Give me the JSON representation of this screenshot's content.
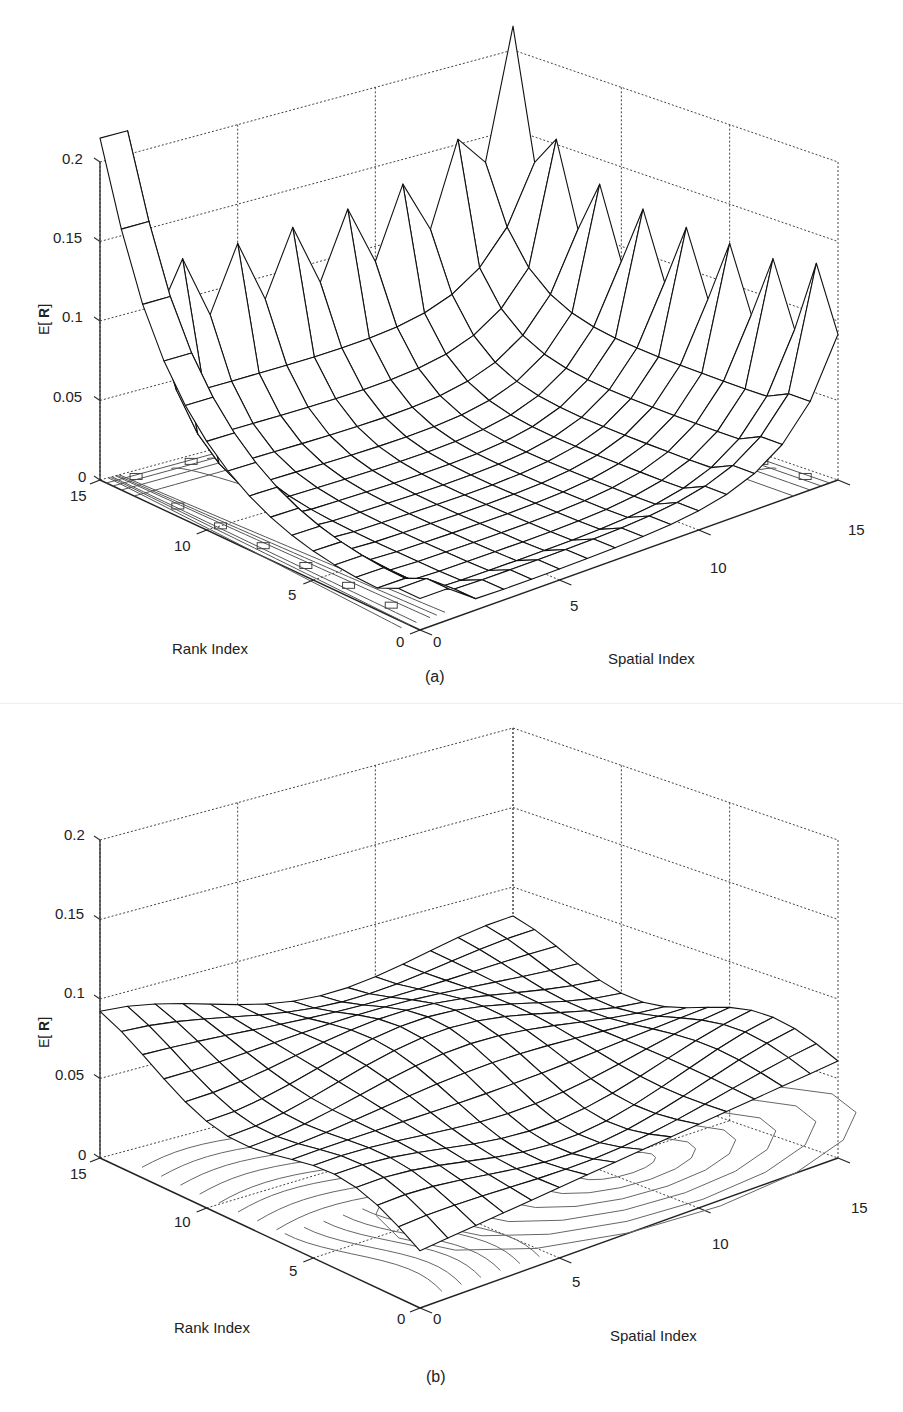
{
  "figure": {
    "panels": [
      {
        "id": "a",
        "caption": "(a)",
        "zlabel_prefix": "E[ ",
        "zlabel_bold": "R",
        "zlabel_suffix": "]",
        "xlabel": "Rank Index",
        "ylabel": "Spatial Index",
        "zticks": [
          "0.2",
          "0.15",
          "0.1",
          "0.05",
          "0"
        ],
        "rank_ticks": [
          "15",
          "10",
          "5",
          "0"
        ],
        "spatial_ticks": [
          "0",
          "5",
          "10",
          "15"
        ]
      },
      {
        "id": "b",
        "caption": "(b)",
        "zlabel_prefix": "E[ ",
        "zlabel_bold": "R",
        "zlabel_suffix": "]",
        "xlabel": "Rank Index",
        "ylabel": "Spatial Index",
        "zticks": [
          "0.2",
          "0.15",
          "0.1",
          "0.05",
          "0"
        ],
        "rank_ticks": [
          "15",
          "10",
          "5",
          "0"
        ],
        "spatial_ticks": [
          "0",
          "5",
          "10",
          "15"
        ]
      }
    ]
  },
  "chart_data": [
    {
      "type": "surface",
      "title": "(a)",
      "xlabel": "Rank Index",
      "ylabel": "Spatial Index",
      "zlabel": "E[R]",
      "xlim": [
        0,
        15
      ],
      "ylim": [
        0,
        15
      ],
      "zlim": [
        0,
        0.2
      ],
      "zticks": [
        0,
        0.05,
        0.1,
        0.15,
        0.2
      ],
      "xticks": [
        0,
        5,
        10,
        15
      ],
      "yticks": [
        0,
        5,
        10,
        15
      ],
      "grid": true,
      "contour_projection": true,
      "description": "Mesh surface on a 16x16 grid with sharp spikes (~0.09-0.12) along the Rank=15 and Spatial=15 boundaries, a deep trough near zero in the central region, and a tall central ridge peaking ~0.21 near rank≈15, spatial≈0",
      "approx_features": {
        "edge_spike_height": 0.09,
        "corner_values": {
          "rank15_spatial0": 0.21,
          "rank0_spatial0": 0.0,
          "rank15_spatial15": 0.12,
          "rank0_spatial15": 0.11
        },
        "interior_min": 0.0
      }
    },
    {
      "type": "surface",
      "title": "(b)",
      "xlabel": "Rank Index",
      "ylabel": "Spatial Index",
      "zlabel": "E[R]",
      "xlim": [
        0,
        15
      ],
      "ylim": [
        0,
        15
      ],
      "zlim": [
        0,
        0.2
      ],
      "zticks": [
        0,
        0.05,
        0.1,
        0.15,
        0.2
      ],
      "xticks": [
        0,
        5,
        10,
        15
      ],
      "yticks": [
        0,
        5,
        10,
        15
      ],
      "grid": true,
      "contour_projection": true,
      "description": "Smooth, nearly flat mesh surface on a 16x16 grid with values between ~0.035 and ~0.1; highest at rank≈15, spatial≈0 corner (~0.1), lowest at rank≈0, spatial≈0 (~0.035)",
      "approx_features": {
        "corner_values": {
          "rank15_spatial0": 0.1,
          "rank0_spatial0": 0.035,
          "rank15_spatial15": 0.07,
          "rank0_spatial15": 0.06
        },
        "mean_value": 0.065
      }
    }
  ]
}
